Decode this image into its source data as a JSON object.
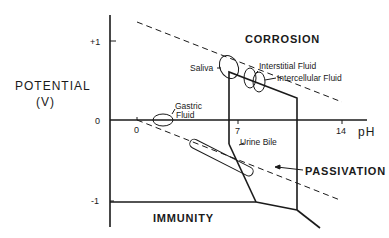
{
  "diagram": {
    "type": "Pourbaix (potential-pH) diagram",
    "y_axis": {
      "title_line1": "POTENTIAL",
      "title_line2": "(V)",
      "ticks": [
        "+1",
        "0",
        "-1"
      ]
    },
    "x_axis": {
      "title": "pH",
      "ticks": [
        "0",
        "7",
        "14"
      ]
    },
    "regions": {
      "corrosion": "CORROSION",
      "passivation": "PASSIVATION",
      "immunity": "IMMUNITY"
    },
    "fluids": {
      "saliva": "Saliva",
      "interstitial": "Interstitial Fluid",
      "intercellular": "Intercellular Fluid",
      "gastric_line1": "Gastric",
      "gastric_line2": "Fluid",
      "urine_bile": "Urine Bile"
    },
    "colors": {
      "ink": "#1a1a1a",
      "background": "#ffffff"
    }
  }
}
